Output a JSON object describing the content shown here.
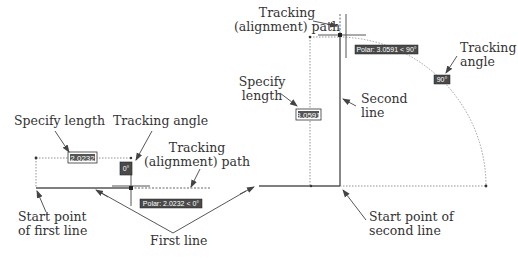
{
  "colors": {
    "background": "#ffffff",
    "line": "#555555",
    "dotted": "#777777",
    "label_text": "#333333",
    "tooltip_bg": "#4a4a4a",
    "tooltip_text": "#ffffff",
    "arrow": "#444444"
  },
  "left_panel": {
    "labels": {
      "specify_length": "Specify length",
      "tracking_angle": "Tracking angle",
      "tracking_path_line1": "Tracking",
      "tracking_path_line2": "(alignment) path",
      "start_point_line1": "Start point",
      "start_point_line2": "of first line",
      "first_line": "First line"
    },
    "length_input": "2.0232",
    "angle_tooltip": "0°",
    "polar_tooltip": "Polar: 2.0232 < 0°"
  },
  "right_panel": {
    "labels": {
      "tracking_path_line1": "Tracking",
      "tracking_path_line2": "(alignment) path",
      "specify_length_line1": "Specify",
      "specify_length_line2": "length",
      "second_line_line1": "Second",
      "second_line_line2": "line",
      "tracking_angle_line1": "Tracking",
      "tracking_angle_line2": "angle",
      "start_point_line1": "Start point of",
      "start_point_line2": "second line"
    },
    "length_input": "3.0591",
    "polar_tooltip": "Polar: 3.0591 < 90°",
    "angle_tooltip": "90°"
  }
}
